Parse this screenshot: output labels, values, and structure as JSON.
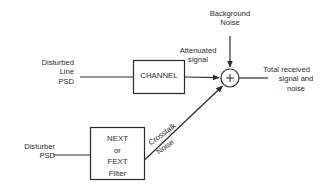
{
  "diagram": {
    "background_color": "#ffffff",
    "stroke_color": "#2b2b2b",
    "text_color": "#2b2b2b",
    "blocks": [
      {
        "id": "channel",
        "label": "CHANNEL"
      },
      {
        "id": "crosstalk_filter",
        "label": "NEXT\nor\nFEXT\nFilter"
      }
    ],
    "summing_junction": {
      "symbol": "+"
    },
    "labels": {
      "disturbed_line_psd": "Disturbed\nLine\nPSD",
      "disturber_psd": "Disturber\nPSD",
      "attenuated_signal": "Attenuated\nsignal",
      "background_noise": "Background\nNoise",
      "crosstalk": "Crosstalk",
      "noise": "Noise",
      "total_received_first": "Total received",
      "total_received_rest": "signal and\nnoise"
    }
  }
}
